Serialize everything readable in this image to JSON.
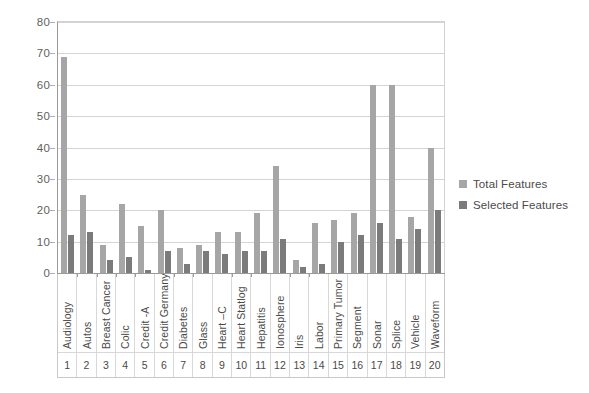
{
  "chart_data": {
    "type": "bar",
    "title": "",
    "xlabel": "",
    "ylabel": "",
    "ylim": [
      0,
      80
    ],
    "ytick_step": 10,
    "yticks": [
      "0",
      "10",
      "20",
      "30",
      "40",
      "50",
      "60",
      "70",
      "80"
    ],
    "grid": true,
    "legend_position": "right",
    "categories": [
      "Audiology",
      "Autos",
      "Breast Cancer",
      "Colic",
      "Credit -A",
      "Credit Germany",
      "Diabetes",
      "Glass",
      "Heart –C",
      "Heart Statlog",
      "Hepatitis",
      "Ionosphere",
      "Iris",
      "Labor",
      "Primary Tumor",
      "Segment",
      "Sonar",
      "Splice",
      "Vehicle",
      "Waveform"
    ],
    "category_indices": [
      "1",
      "2",
      "3",
      "4",
      "5",
      "6",
      "7",
      "8",
      "9",
      "10",
      "11",
      "12",
      "13",
      "14",
      "15",
      "16",
      "17",
      "18",
      "19",
      "20"
    ],
    "series": [
      {
        "name": "Total Features",
        "color": "#a6a6a6",
        "values": [
          69,
          25,
          9,
          22,
          15,
          20,
          8,
          9,
          13,
          13,
          19,
          34,
          4,
          16,
          17,
          19,
          60,
          60,
          18,
          40
        ]
      },
      {
        "name": "Selected Features",
        "color": "#7b7b7b",
        "values": [
          12,
          13,
          4,
          5,
          1,
          7,
          3,
          7,
          6,
          7,
          7,
          11,
          2,
          3,
          10,
          12,
          16,
          11,
          14,
          20
        ]
      }
    ]
  }
}
